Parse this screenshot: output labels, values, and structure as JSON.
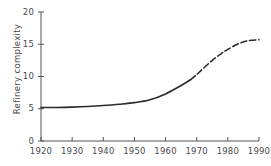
{
  "chart_data": {
    "type": "line",
    "title": "",
    "xlabel": "",
    "ylabel": "Refinery complexity",
    "xlim": [
      1920,
      1990
    ],
    "ylim": [
      0,
      20
    ],
    "xticks": [
      1920,
      1930,
      1940,
      1950,
      1960,
      1970,
      1980,
      1990
    ],
    "yticks": [
      0,
      5,
      10,
      15,
      20
    ],
    "xtick_labels": [
      "1920",
      "1930",
      "1940",
      "1950",
      "1960",
      "1970",
      "1980",
      "1990"
    ],
    "ytick_labels": [
      "0",
      "5",
      "10",
      "15",
      "20"
    ],
    "grid": false,
    "legend": null,
    "line_color": "#2b2b2b",
    "series": [
      {
        "name": "Refinery complexity",
        "style": "solid",
        "x": [
          1920,
          1925,
          1930,
          1935,
          1940,
          1945,
          1950,
          1955,
          1960,
          1965,
          1968
        ],
        "values": [
          5.2,
          5.2,
          5.25,
          5.35,
          5.5,
          5.7,
          5.95,
          6.4,
          7.3,
          8.6,
          9.5
        ]
      },
      {
        "name": "Refinery complexity (projected)",
        "style": "dashed",
        "x": [
          1968,
          1970,
          1972,
          1975,
          1978,
          1980,
          1983,
          1986,
          1990
        ],
        "values": [
          9.5,
          10.3,
          11.2,
          12.5,
          13.6,
          14.2,
          15.0,
          15.5,
          15.7
        ]
      }
    ]
  },
  "axis": {
    "spine_color": "#555555",
    "tick_color": "#555555"
  }
}
